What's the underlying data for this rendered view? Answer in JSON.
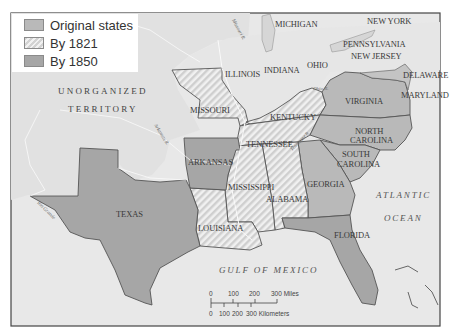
{
  "map": {
    "title": "",
    "legend": [
      {
        "label": "Original states",
        "style": "solid-gray",
        "color": "#b9b9b9"
      },
      {
        "label": "By 1821",
        "style": "hatched",
        "color": "#e6e6e6"
      },
      {
        "label": "By 1850",
        "style": "solid-dark-gray",
        "color": "#a6a6a6"
      }
    ],
    "regions": {
      "unorganized": "UNORGANIZED",
      "territory": "TERRITORY"
    },
    "states": {
      "michigan": "MICHIGAN",
      "new_york": "NEW YORK",
      "pennsylvania": "PENNSYLVANIA",
      "new_jersey": "NEW JERSEY",
      "delaware": "DELAWARE",
      "maryland": "MARYLAND",
      "illinois": "ILLINOIS",
      "indiana": "INDIANA",
      "ohio": "OHIO",
      "missouri": "MISSOURI",
      "kentucky": "KENTUCKY",
      "virginia": "VIRGINIA",
      "north_carolina_1": "NORTH",
      "north_carolina_2": "CAROLINA",
      "tennessee": "TENNESSEE",
      "south_carolina_1": "SOUTH",
      "south_carolina_2": "CAROLINA",
      "arkansas": "ARKANSAS",
      "georgia": "GEORGIA",
      "mississippi": "MISSISSIPPI",
      "alabama": "ALABAMA",
      "texas": "TEXAS",
      "louisiana": "LOUISIANA",
      "florida": "FLORIDA"
    },
    "water": {
      "atlantic_1": "ATLANTIC",
      "atlantic_2": "OCEAN",
      "gulf": "GULF OF MEXICO"
    },
    "rivers": {
      "missouri": "Missouri R.",
      "arkansas": "Arkansas R.",
      "ohio": "Ohio R.",
      "rio_grande": "Rio Grande",
      "tennessee": "Tennessee R."
    },
    "scale": {
      "miles_ticks": [
        "0",
        "100",
        "200",
        "300 Miles"
      ],
      "km_ticks": [
        "0",
        "100",
        "200",
        "300 Kilometers"
      ]
    },
    "colors": {
      "water": "#e9e9e9",
      "land_other": "#e3e3e3",
      "original_states": "#b9b9b9",
      "by_1850": "#a6a6a6",
      "border": "#555555"
    }
  }
}
